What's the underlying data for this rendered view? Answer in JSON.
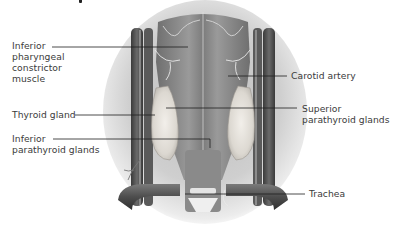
{
  "diagram": {
    "style": "grayscale medical illustration",
    "colors": {
      "background": "#ffffff",
      "label_text": "#3b3b3b",
      "leader_line": "#1e1e1e",
      "backdrop_shadow": "#c9c9c9",
      "muscle": "#8d8d8d",
      "vessel_dark": "#4a4a4a",
      "gland": "#e6e2dc"
    },
    "labels": [
      {
        "id": "inferior-pharyngeal-constrictor-muscle",
        "lines": [
          "Inferior",
          "pharyngeal",
          "constrictor",
          "muscle"
        ],
        "side": "left"
      },
      {
        "id": "thyroid-gland",
        "lines": [
          "Thyroid gland"
        ],
        "side": "left"
      },
      {
        "id": "inferior-parathyroid-glands",
        "lines": [
          "Inferior",
          "parathyroid glands"
        ],
        "side": "left"
      },
      {
        "id": "carotid-artery",
        "lines": [
          "Carotid artery"
        ],
        "side": "right"
      },
      {
        "id": "superior-parathyroid-glands",
        "lines": [
          "Superior",
          "parathyroid glands"
        ],
        "side": "right"
      },
      {
        "id": "trachea",
        "lines": [
          "Trachea"
        ],
        "side": "right"
      }
    ]
  }
}
